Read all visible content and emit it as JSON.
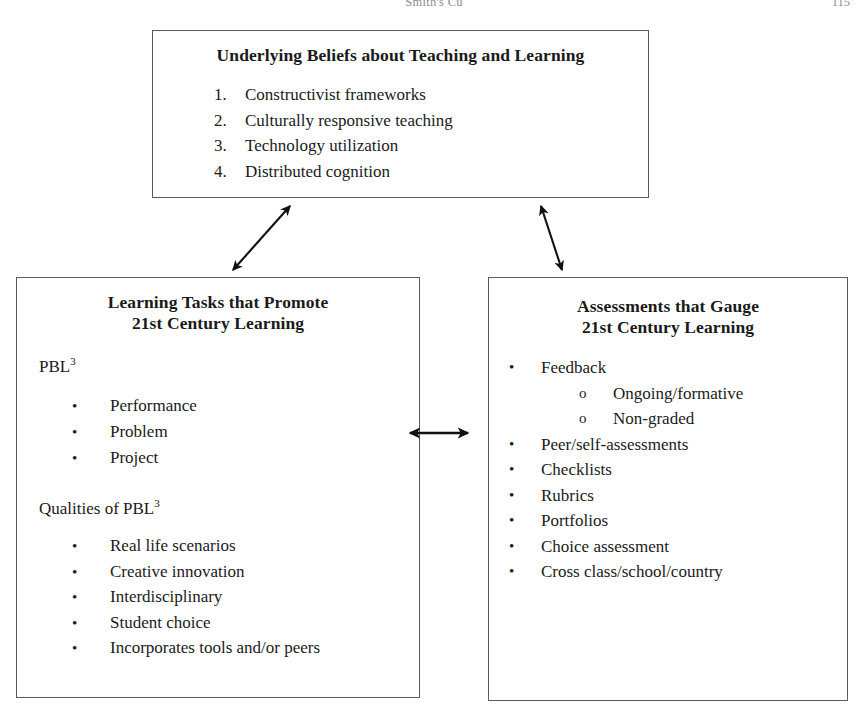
{
  "page": {
    "running_head": "Smith's Cu",
    "page_number": "115"
  },
  "diagram": {
    "beliefs_box": {
      "title": "Underlying Beliefs about Teaching and Learning",
      "items": [
        "Constructivist frameworks",
        "Culturally responsive teaching",
        "Technology utilization",
        "Distributed cognition"
      ]
    },
    "tasks_box": {
      "title_line1": "Learning Tasks that Promote",
      "title_line2": "21st Century Learning",
      "pbl_label": "PBL",
      "pbl_superscript": "3",
      "pbl_items": [
        "Performance",
        "Problem",
        "Project"
      ],
      "qualities_label": "Qualities of PBL",
      "qualities_superscript": "3",
      "qualities_items": [
        "Real life scenarios",
        "Creative innovation",
        "Interdisciplinary",
        "Student choice",
        "Incorporates tools and/or peers"
      ]
    },
    "assessments_box": {
      "title_line1": "Assessments that Gauge",
      "title_line2": "21st Century Learning",
      "items": [
        {
          "label": "Feedback",
          "sub_items": [
            "Ongoing/formative",
            "Non-graded"
          ]
        },
        {
          "label": "Peer/self-assessments",
          "sub_items": []
        },
        {
          "label": "Checklists",
          "sub_items": []
        },
        {
          "label": "Rubrics",
          "sub_items": []
        },
        {
          "label": "Portfolios",
          "sub_items": []
        },
        {
          "label": "Choice assessment",
          "sub_items": []
        },
        {
          "label": "Cross class/school/country",
          "sub_items": []
        }
      ]
    },
    "bullet_glyph": "•",
    "sub_bullet_glyph": "o",
    "connectors": [
      {
        "name": "beliefs-to-tasks-arrow",
        "style": "double-headed diagonal"
      },
      {
        "name": "beliefs-to-assessments-arrow",
        "style": "double-headed diagonal"
      },
      {
        "name": "tasks-to-assessments-arrow",
        "style": "double-headed horizontal"
      }
    ],
    "colors": {
      "border": "#5a5a5a",
      "text": "#1a1a1a",
      "background": "#ffffff"
    }
  }
}
